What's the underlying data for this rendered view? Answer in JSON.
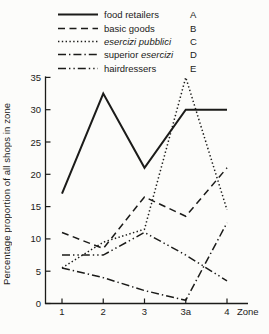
{
  "figure": {
    "background": "#fcfcfa",
    "ink": "#1b1b19"
  },
  "legend": {
    "items": [
      {
        "letter": "A",
        "prefix": "food retailers",
        "italic": "",
        "line_style": "solid"
      },
      {
        "letter": "B",
        "prefix": "basic goods",
        "italic": "",
        "line_style": "dashed"
      },
      {
        "letter": "C",
        "prefix": "",
        "italic": "esercizi pubblici",
        "line_style": "dotted"
      },
      {
        "letter": "D",
        "prefix": "superior ",
        "italic": "esercizi",
        "line_style": "dash-dot"
      },
      {
        "letter": "E",
        "prefix": "hairdressers",
        "italic": "",
        "line_style": "dash-dot-dot"
      }
    ]
  },
  "chart_data": {
    "type": "line",
    "title": "",
    "xlabel": "Zone",
    "ylabel": "Percentage proportion of all shops in zone",
    "categories": [
      "1",
      "2",
      "3",
      "3a",
      "4"
    ],
    "ylim": [
      0,
      35
    ],
    "yticks": [
      0,
      5,
      10,
      15,
      20,
      25,
      30,
      35
    ],
    "grid": false,
    "legend_position": "top",
    "series": [
      {
        "name": "food retailers",
        "letter": "A",
        "line_style": "solid",
        "values": [
          17,
          32.5,
          21,
          30,
          30
        ]
      },
      {
        "name": "basic goods",
        "letter": "B",
        "line_style": "dashed",
        "values": [
          11,
          8.5,
          16.5,
          13.5,
          21
        ]
      },
      {
        "name": "esercizi pubblici",
        "letter": "C",
        "line_style": "dotted",
        "values": [
          5.5,
          9.5,
          11.5,
          35,
          14.5
        ]
      },
      {
        "name": "superior esercizi",
        "letter": "D",
        "line_style": "dash-dot",
        "values": [
          5.5,
          4,
          2,
          0.5,
          12.5
        ]
      },
      {
        "name": "hairdressers",
        "letter": "E",
        "line_style": "dash-dot-dot",
        "values": [
          7.5,
          7.5,
          11,
          7.5,
          3.5
        ]
      }
    ]
  }
}
